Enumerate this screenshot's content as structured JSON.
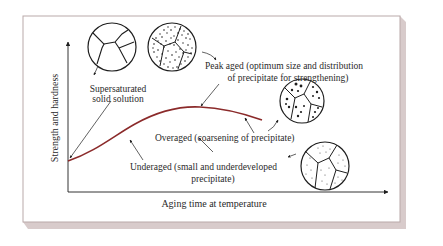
{
  "diagram": {
    "axes": {
      "y_label": "Strength and hardness",
      "x_label": "Aging time at temperature"
    },
    "colors": {
      "curve": "#8b2a2a",
      "ink": "#1e1e1e",
      "card_shadow": "#d8cbcb",
      "card_border": "#b9a9a9",
      "background": "#ffffff"
    },
    "labels": {
      "supersaturated": {
        "line1": "Supersaturated",
        "line2": "solid solution"
      },
      "peak_aged": {
        "line1": "Peak aged (optimum size and distribution",
        "line2": "of precipitate for strengthening)"
      },
      "overaged": {
        "line1": "Overaged (coarsening of precipitate)"
      },
      "underaged": {
        "line1": "Underaged (small and underdeveloped",
        "line2": "precipitate)"
      }
    },
    "microstructures": [
      {
        "name": "supersaturated",
        "precipitate": "none"
      },
      {
        "name": "peak-aged",
        "precipitate": "fine dense"
      },
      {
        "name": "overaged",
        "precipitate": "coarse sparse"
      },
      {
        "name": "underaged",
        "precipitate": "very fine sparse"
      }
    ]
  }
}
